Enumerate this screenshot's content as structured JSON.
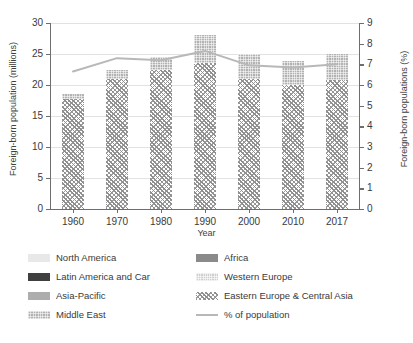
{
  "chart_data": {
    "type": "bar",
    "title": "",
    "subtitle": "",
    "xlabel": "Year",
    "ylabel": "Foreign-born population (millions)",
    "y2label": "Foreign-born populations (%)",
    "categories": [
      "1960",
      "1970",
      "1980",
      "1990",
      "2000",
      "2010",
      "2017"
    ],
    "ylim": [
      0,
      30
    ],
    "yticks": [
      "0",
      "5",
      "10",
      "15",
      "20",
      "25",
      "30"
    ],
    "y2lim": [
      0,
      9
    ],
    "y2ticks": [
      "0",
      "1",
      "2",
      "3",
      "4",
      "5",
      "6",
      "7",
      "8",
      "9"
    ],
    "grid": "horizontal",
    "legend_position": "below-plot-two-columns",
    "stacked": true,
    "series": [
      {
        "name": "Eastern Europe & Central Asia",
        "axis": "left",
        "pattern": "diagonal-cross-hatch",
        "color": "#919191",
        "values": [
          17.8,
          20.9,
          22.4,
          23.6,
          21.0,
          20.0,
          20.8
        ]
      },
      {
        "name": "Middle East",
        "axis": "left",
        "pattern": "fine-checker",
        "color": "#b2b2b2",
        "values": [
          0.7,
          1.6,
          2.1,
          4.4,
          4.0,
          3.8,
          4.2
        ]
      }
    ],
    "bar_totals": [
      18.5,
      22.5,
      24.5,
      28.0,
      25.0,
      23.8,
      25.0
    ],
    "line_series": {
      "name": "% of population",
      "axis": "right",
      "color": "#b8b8b8",
      "values": [
        6.65,
        7.3,
        7.2,
        7.65,
        6.95,
        6.85,
        7.0
      ]
    },
    "legend": [
      {
        "label": "North America",
        "swatch": "sw-na",
        "kind": "box"
      },
      {
        "label": "Africa",
        "swatch": "sw-africa",
        "kind": "box"
      },
      {
        "label": "Latin America and Car",
        "swatch": "sw-latam",
        "kind": "box"
      },
      {
        "label": "Western Europe",
        "swatch": "sw-weur",
        "kind": "box"
      },
      {
        "label": "Asia-Pacific",
        "swatch": "sw-apac",
        "kind": "box"
      },
      {
        "label": "Eastern Europe & Central Asia",
        "swatch": "pat-eeca",
        "kind": "box"
      },
      {
        "label": "Middle East",
        "swatch": "pat-me",
        "kind": "box"
      },
      {
        "label": "% of population",
        "swatch": "lg-line",
        "kind": "line"
      }
    ]
  },
  "colors": {
    "axis": "#6e6e6e",
    "grid": "#e2e2e2",
    "text": "#3a3a3a",
    "line": "#b8b8b8",
    "background": "#ffffff"
  }
}
